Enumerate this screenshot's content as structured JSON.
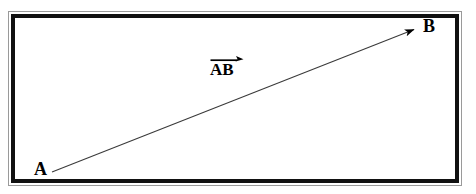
{
  "diagram": {
    "background_color": "#ffffff",
    "frame": {
      "outer_rule_color": "#9a9a9a",
      "inner_rule_color": "#111111",
      "fill_color": "#ffffff"
    },
    "vector": {
      "label": "AB",
      "notation": "overline-arrow",
      "line_color": "#3a3a3a",
      "arrowhead_color": "#000000",
      "start_point": {
        "name": "A",
        "x": 52,
        "y": 172
      },
      "end_point": {
        "name": "B",
        "x": 420,
        "y": 26
      }
    },
    "labels": {
      "start": "A",
      "end": "B",
      "vector": "AB"
    }
  }
}
